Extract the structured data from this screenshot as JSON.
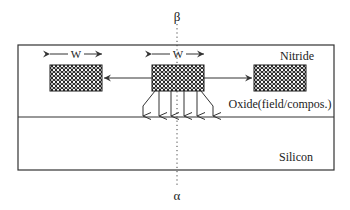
{
  "diagram": {
    "axis_top_label": "β",
    "axis_bottom_label": "α",
    "layers": {
      "nitride": "Nitride",
      "oxide": "Oxide(field/compos.)",
      "silicon": "Silicon"
    },
    "width_labels": {
      "left": "W",
      "center": "W"
    },
    "colors": {
      "line": "#333333",
      "hatch_fill": "#1a1a1a",
      "hatch_dot": "#ffffff",
      "background": "#ffffff"
    },
    "blocks": [
      {
        "name": "left-block",
        "x": 50,
        "y": 65,
        "w": 52,
        "h": 26
      },
      {
        "name": "center-block",
        "x": 152,
        "y": 65,
        "w": 52,
        "h": 26
      },
      {
        "name": "right-block",
        "x": 254,
        "y": 65,
        "w": 52,
        "h": 26
      }
    ]
  }
}
